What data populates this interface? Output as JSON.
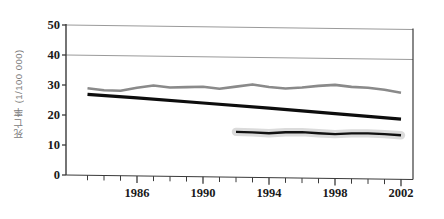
{
  "chart_data": {
    "type": "line",
    "title": "",
    "xlabel": "",
    "ylabel": "死亡率（1/100 000）",
    "ylabel_plain": "死亡率 (1/100 000)",
    "xlim": [
      1983,
      2002
    ],
    "ylim": [
      0,
      50
    ],
    "grid": "horizontal gridlines at 40 and 50 only",
    "legend": "none",
    "y_ticks": [
      0,
      10,
      20,
      30,
      40,
      50
    ],
    "y_tick_labels": [
      "0",
      "10",
      "20",
      "30",
      "40",
      "50"
    ],
    "x_ticks": [
      1986,
      1990,
      1994,
      1998,
      2002
    ],
    "x_tick_labels": [
      "1986",
      "1990",
      "1994",
      "1998",
      "2002"
    ],
    "x_minor_ticks": [
      1983,
      1984,
      1985,
      1986,
      1987,
      1988,
      1989,
      1990,
      1991,
      1992,
      1993,
      1994,
      1995,
      1996,
      1997,
      1998,
      1999,
      2000,
      2001,
      2002
    ],
    "series": [
      {
        "name": "gray-upper-series",
        "color": "#8a8a8a",
        "style": "solid",
        "width": 2.6,
        "x": [
          1983,
          1984,
          1985,
          1986,
          1987,
          1988,
          1989,
          1990,
          1991,
          1992,
          1993,
          1994,
          1995,
          1996,
          1997,
          1998,
          1999,
          2000,
          2001,
          2002
        ],
        "values": [
          29.0,
          28.4,
          28.3,
          29.4,
          30.2,
          29.6,
          29.8,
          30.0,
          29.4,
          30.2,
          31.0,
          30.2,
          29.8,
          30.2,
          30.8,
          31.2,
          30.6,
          30.4,
          29.8,
          28.9
        ]
      },
      {
        "name": "black-declining-series",
        "color": "#0d0d0d",
        "style": "solid",
        "width": 3.2,
        "x": [
          1983,
          1986,
          1990,
          1994,
          1998,
          2002
        ],
        "values": [
          27.0,
          26.0,
          24.6,
          23.2,
          21.6,
          20.1
        ]
      },
      {
        "name": "black-lower-series",
        "color": "#111111",
        "style": "solid-with-halo",
        "width": 2.4,
        "halo_color": "#cfcfcf",
        "x": [
          1992,
          1993,
          1994,
          1995,
          1996,
          1997,
          1998,
          1999,
          2000,
          2001,
          2002
        ],
        "values": [
          15.1,
          15.0,
          14.8,
          15.2,
          15.3,
          15.0,
          14.8,
          15.1,
          15.2,
          15.0,
          14.7
        ]
      }
    ]
  },
  "axes": {
    "y_title": "死亡率 (1/100 000)"
  },
  "colors": {
    "axis": "#3a3a3a",
    "grid": "#9a9a9a",
    "gray_series": "#8a8a8a",
    "black_series": "#0d0d0d",
    "text": "#1a1a1a"
  }
}
